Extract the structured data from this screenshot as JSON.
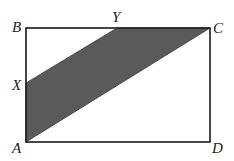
{
  "diagram": {
    "type": "geometry",
    "colors": {
      "stroke": "#1a1a1a",
      "shade": "#5a5a5a",
      "background": "#ffffff"
    },
    "points": {
      "A": {
        "label": "A",
        "x": 26,
        "y": 142
      },
      "B": {
        "label": "B",
        "x": 26,
        "y": 28
      },
      "C": {
        "label": "C",
        "x": 210,
        "y": 28
      },
      "D": {
        "label": "D",
        "x": 210,
        "y": 142
      },
      "X": {
        "label": "X",
        "x": 26,
        "y": 83
      },
      "Y": {
        "label": "Y",
        "x": 117,
        "y": 28
      }
    },
    "shaded_region": [
      "A",
      "X",
      "Y",
      "C"
    ]
  }
}
